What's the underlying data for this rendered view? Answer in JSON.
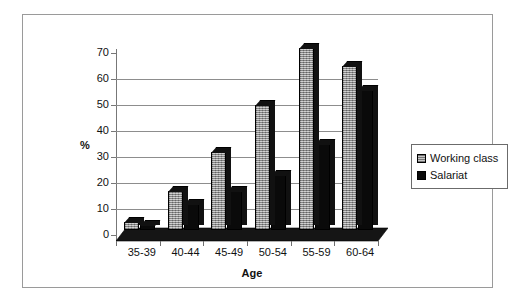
{
  "chart_data": {
    "type": "bar",
    "title": "",
    "xlabel": "Age",
    "ylabel": "%",
    "ylim": [
      0,
      70
    ],
    "ytick_step": 10,
    "yticks": [
      "0",
      "10",
      "20",
      "30",
      "40",
      "50",
      "60",
      "70"
    ],
    "grid": true,
    "grid_levels": [
      10,
      20,
      30,
      40,
      50,
      60
    ],
    "legend_position": "right",
    "style": "3d-clustered-column",
    "categories": [
      "35-39",
      "40-44",
      "45-49",
      "50-54",
      "55-59",
      "60-64"
    ],
    "series": [
      {
        "name": "Working class",
        "color": "#a8a8a8",
        "values": [
          3,
          15,
          30,
          48,
          70,
          63
        ]
      },
      {
        "name": "Salariat",
        "color": "#0a0a0a",
        "values": [
          2,
          10,
          15,
          21,
          33,
          54
        ]
      }
    ]
  },
  "legend": {
    "items": [
      {
        "label": "Working class",
        "swatch": "gray-textured-swatch"
      },
      {
        "label": "Salariat",
        "swatch": "black-swatch"
      }
    ]
  },
  "axes": {
    "y_title": "%",
    "x_title": "Age"
  }
}
